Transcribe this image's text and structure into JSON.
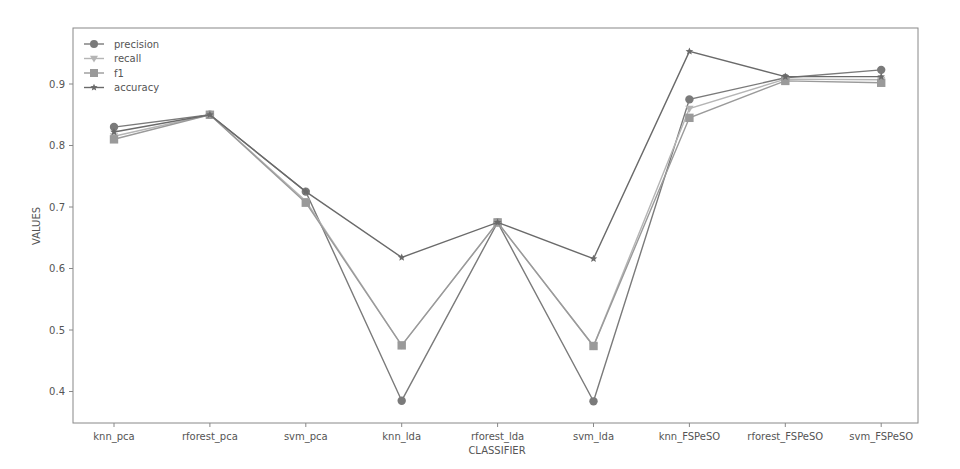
{
  "chart_data": {
    "type": "line",
    "title": "",
    "xlabel": "CLASSIFIER",
    "ylabel": "VALUES",
    "categories": [
      "knn_pca",
      "rforest_pca",
      "svm_pca",
      "knn_lda",
      "rforest_lda",
      "svm_lda",
      "knn_FSPeSO",
      "rforest_FSPeSO",
      "svm_FSPeSO"
    ],
    "yticks": [
      0.4,
      0.5,
      0.6,
      0.7,
      0.8,
      0.9
    ],
    "ytick_labels": [
      "0.4",
      "0.5",
      "0.6",
      "0.7",
      "0.8",
      "0.9"
    ],
    "ylim": [
      0.36,
      0.97
    ],
    "grid": false,
    "legend_position": "upper left",
    "series": [
      {
        "name": "precision",
        "marker": "circle",
        "color": "#7a7a7a",
        "values": [
          0.83,
          0.85,
          0.725,
          0.385,
          0.675,
          0.384,
          0.875,
          0.91,
          0.923
        ]
      },
      {
        "name": "recall",
        "marker": "triangle-down",
        "color": "#b5b5b5",
        "values": [
          0.815,
          0.85,
          0.71,
          0.475,
          0.675,
          0.474,
          0.86,
          0.908,
          0.907
        ]
      },
      {
        "name": "f1",
        "marker": "square",
        "color": "#9a9a9a",
        "values": [
          0.81,
          0.85,
          0.707,
          0.475,
          0.675,
          0.474,
          0.845,
          0.905,
          0.902
        ]
      },
      {
        "name": "accuracy",
        "marker": "star",
        "color": "#6a6a6a",
        "values": [
          0.822,
          0.85,
          0.725,
          0.618,
          0.675,
          0.616,
          0.953,
          0.912,
          0.912
        ]
      }
    ]
  }
}
